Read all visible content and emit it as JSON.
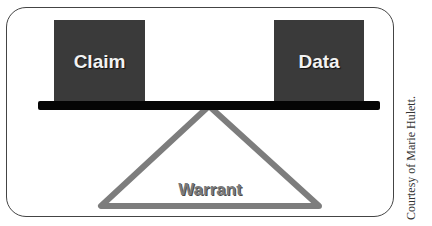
{
  "diagram": {
    "type": "balance-scale",
    "left_box": {
      "label": "Claim",
      "color": "#3a3a3a"
    },
    "right_box": {
      "label": "Data",
      "color": "#3a3a3a"
    },
    "beam": {
      "color": "#050505"
    },
    "fulcrum": {
      "label": "Warrant",
      "stroke_color": "#7a7a7a"
    }
  },
  "credit": "Courtesy of Marie Hulett."
}
